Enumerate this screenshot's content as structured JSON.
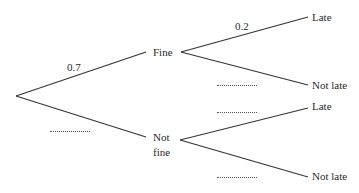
{
  "diagram": {
    "type": "probability-tree",
    "first_stage": {
      "branches": [
        {
          "label": "Fine",
          "probability": "0.7"
        },
        {
          "label_line1": "Not",
          "label_line2": "fine",
          "probability": "............"
        }
      ]
    },
    "second_stage": {
      "fine": [
        {
          "label": "Late",
          "probability": "0.2"
        },
        {
          "label": "Not late",
          "probability": "............"
        }
      ],
      "not_fine": [
        {
          "label": "Late",
          "probability": "............"
        },
        {
          "label": "Not late",
          "probability": "............"
        }
      ]
    }
  }
}
